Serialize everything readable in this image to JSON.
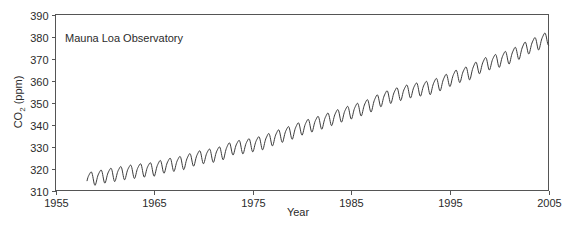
{
  "chart_data": {
    "type": "line",
    "title": "",
    "annotation": "Mauna Loa Observatory",
    "xlabel": "Year",
    "ylabel": "CO2 (ppm)",
    "ylabel_main": "CO",
    "ylabel_sub": "2",
    "ylabel_unit": " (ppm)",
    "xlim": [
      1955,
      2005
    ],
    "ylim": [
      310,
      390
    ],
    "grid": false,
    "legend": false,
    "xticks": [
      1955,
      1965,
      1975,
      1985,
      1995,
      2005
    ],
    "xtick_labels": [
      "1955",
      "1965",
      "1975",
      "1985",
      "1995",
      "2005"
    ],
    "yticks": [
      310,
      320,
      330,
      340,
      350,
      360,
      370,
      380,
      390
    ],
    "ytick_labels": [
      "310",
      "320",
      "330",
      "340",
      "350",
      "360",
      "370",
      "380",
      "390"
    ],
    "series": [
      {
        "name": "Atmospheric CO2 concentration",
        "color": "#3a3a3a",
        "description": "Monthly mean CO2 with annual seasonal cycle (Keeling Curve)",
        "seasonal_amplitude_ppm": 6,
        "x_start": 1958.2,
        "x_end": 2005.0,
        "annual_means": [
          {
            "x": 1958,
            "y": 315.3
          },
          {
            "x": 1959,
            "y": 315.9
          },
          {
            "x": 1960,
            "y": 316.9
          },
          {
            "x": 1961,
            "y": 317.6
          },
          {
            "x": 1962,
            "y": 318.4
          },
          {
            "x": 1963,
            "y": 319.0
          },
          {
            "x": 1964,
            "y": 319.6
          },
          {
            "x": 1965,
            "y": 320.0
          },
          {
            "x": 1966,
            "y": 321.4
          },
          {
            "x": 1967,
            "y": 322.2
          },
          {
            "x": 1968,
            "y": 323.0
          },
          {
            "x": 1969,
            "y": 324.6
          },
          {
            "x": 1970,
            "y": 325.7
          },
          {
            "x": 1971,
            "y": 326.3
          },
          {
            "x": 1972,
            "y": 327.5
          },
          {
            "x": 1973,
            "y": 329.7
          },
          {
            "x": 1974,
            "y": 330.2
          },
          {
            "x": 1975,
            "y": 331.1
          },
          {
            "x": 1976,
            "y": 332.0
          },
          {
            "x": 1977,
            "y": 333.8
          },
          {
            "x": 1978,
            "y": 335.4
          },
          {
            "x": 1979,
            "y": 336.8
          },
          {
            "x": 1980,
            "y": 338.7
          },
          {
            "x": 1981,
            "y": 340.1
          },
          {
            "x": 1982,
            "y": 341.4
          },
          {
            "x": 1983,
            "y": 343.0
          },
          {
            "x": 1984,
            "y": 344.6
          },
          {
            "x": 1985,
            "y": 346.0
          },
          {
            "x": 1986,
            "y": 347.4
          },
          {
            "x": 1987,
            "y": 349.2
          },
          {
            "x": 1988,
            "y": 351.6
          },
          {
            "x": 1989,
            "y": 353.1
          },
          {
            "x": 1990,
            "y": 354.4
          },
          {
            "x": 1991,
            "y": 355.6
          },
          {
            "x": 1992,
            "y": 356.4
          },
          {
            "x": 1993,
            "y": 357.1
          },
          {
            "x": 1994,
            "y": 358.8
          },
          {
            "x": 1995,
            "y": 360.8
          },
          {
            "x": 1996,
            "y": 362.6
          },
          {
            "x": 1997,
            "y": 363.8
          },
          {
            "x": 1998,
            "y": 366.6
          },
          {
            "x": 1999,
            "y": 368.3
          },
          {
            "x": 2000,
            "y": 369.5
          },
          {
            "x": 2001,
            "y": 371.0
          },
          {
            "x": 2002,
            "y": 373.1
          },
          {
            "x": 2003,
            "y": 375.6
          },
          {
            "x": 2004,
            "y": 377.4
          },
          {
            "x": 2005,
            "y": 379.6
          }
        ]
      }
    ]
  }
}
